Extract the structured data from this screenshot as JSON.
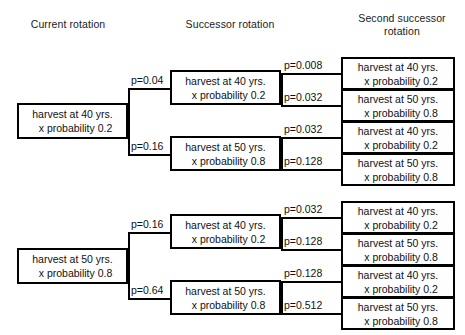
{
  "headers": {
    "current": "Current rotation",
    "successor": "Successor rotation",
    "second": "Second successor rotation"
  },
  "labels": {
    "harvest40_line1": "harvest at 40 yrs.",
    "harvest40_line2": "x probability 0.2",
    "harvest50_line1": "harvest at 50 yrs.",
    "harvest50_line2": "x probability 0.8"
  },
  "tree_top": {
    "root": {
      "line1": "harvest at 40 yrs.",
      "line2": "x probability 0.2"
    },
    "branch_a": {
      "p": "p=0.04",
      "node": {
        "line1": "harvest at 40 yrs.",
        "line2": "x probability 0.2"
      },
      "leaves": [
        {
          "p": "p=0.008",
          "line1": "harvest at 40 yrs.",
          "line2": "x probability 0.2"
        },
        {
          "p": "p=0.032",
          "line1": "harvest at 50 yrs.",
          "line2": "x probability 0.8"
        }
      ]
    },
    "branch_b": {
      "p": "p=0.16",
      "node": {
        "line1": "harvest at 50 yrs.",
        "line2": "x probability 0.8"
      },
      "leaves": [
        {
          "p": "p=0.032",
          "line1": "harvest at 40 yrs.",
          "line2": "x probability 0.2"
        },
        {
          "p": "p=0.128",
          "line1": "harvest at 50 yrs.",
          "line2": "x probability 0.8"
        }
      ]
    }
  },
  "tree_bottom": {
    "root": {
      "line1": "harvest at 50 yrs.",
      "line2": "x probability 0.8"
    },
    "branch_a": {
      "p": "p=0.16",
      "node": {
        "line1": "harvest at 40 yrs.",
        "line2": "x probability 0.2"
      },
      "leaves": [
        {
          "p": "p=0.032",
          "line1": "harvest at 40 yrs.",
          "line2": "x probability 0.2"
        },
        {
          "p": "p=0.128",
          "line1": "harvest at 50 yrs.",
          "line2": "x probability 0.8"
        }
      ]
    },
    "branch_b": {
      "p": "p=0.64",
      "node": {
        "line1": "harvest at 50 yrs.",
        "line2": "x probability 0.8"
      },
      "leaves": [
        {
          "p": "p=0.128",
          "line1": "harvest at 40 yrs.",
          "line2": "x probability 0.2"
        },
        {
          "p": "p=0.512",
          "line1": "harvest at 50 yrs.",
          "line2": "x probability 0.8"
        }
      ]
    }
  }
}
